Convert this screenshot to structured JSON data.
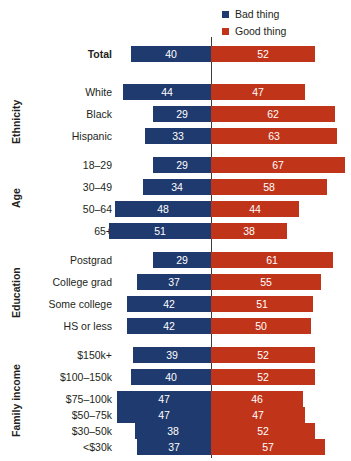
{
  "legend": {
    "items": [
      {
        "label": "Bad thing",
        "color": "#1f3a6e",
        "key": "bad"
      },
      {
        "label": "Good thing",
        "color": "#c0341a",
        "key": "good"
      }
    ]
  },
  "axis": {
    "center_value": 0,
    "units_per_px": 2.0
  },
  "groups": [
    {
      "name": "",
      "label": ""
    },
    {
      "name": "ethnicity",
      "label": "Ethnicity"
    },
    {
      "name": "age",
      "label": "Age"
    },
    {
      "name": "education",
      "label": "Education"
    },
    {
      "name": "family-income",
      "label": "Family income"
    }
  ],
  "chart_data": {
    "type": "bar",
    "orientation": "horizontal",
    "subtype": "diverging",
    "title": "",
    "subtitle": "",
    "xlabel": "",
    "ylabel": "",
    "grid": false,
    "legend_position": "top-right",
    "legend": [
      "Bad thing",
      "Good thing"
    ],
    "colors": {
      "Bad thing": "#1f3a6e",
      "Good thing": "#c0341a"
    },
    "categories": [
      "Total",
      "White",
      "Black",
      "Hispanic",
      "18–29",
      "30–49",
      "50–64",
      "65+",
      "Postgrad",
      "College grad",
      "Some college",
      "HS or less",
      "$150k+",
      "$100–150k",
      "$75–100k",
      "$50–75k",
      "$30–50k",
      "<$30k"
    ],
    "category_groups": [
      "",
      "Ethnicity",
      "Ethnicity",
      "Ethnicity",
      "Age",
      "Age",
      "Age",
      "Age",
      "Education",
      "Education",
      "Education",
      "Education",
      "Family income",
      "Family income",
      "Family income",
      "Family income",
      "Family income",
      "Family income"
    ],
    "series": [
      {
        "name": "Bad thing",
        "values": [
          40,
          44,
          29,
          33,
          29,
          34,
          48,
          51,
          29,
          37,
          42,
          42,
          39,
          40,
          47,
          47,
          38,
          37
        ]
      },
      {
        "name": "Good thing",
        "values": [
          52,
          47,
          62,
          63,
          67,
          58,
          44,
          38,
          61,
          55,
          51,
          50,
          52,
          52,
          46,
          47,
          52,
          57
        ]
      }
    ]
  },
  "rows": [
    {
      "label": "Total",
      "group": "",
      "bad": 40,
      "good": 52,
      "top": 46,
      "bold": true
    },
    {
      "label": "White",
      "group": "Ethnicity",
      "bad": 44,
      "good": 47,
      "top": 84,
      "bold": false
    },
    {
      "label": "Black",
      "group": "Ethnicity",
      "bad": 29,
      "good": 62,
      "top": 106,
      "bold": false
    },
    {
      "label": "Hispanic",
      "group": "Ethnicity",
      "bad": 33,
      "good": 63,
      "top": 128,
      "bold": false
    },
    {
      "label": "18–29",
      "group": "Age",
      "bad": 29,
      "good": 67,
      "top": 157,
      "bold": false
    },
    {
      "label": "30–49",
      "group": "Age",
      "bad": 34,
      "good": 58,
      "top": 179,
      "bold": false
    },
    {
      "label": "50–64",
      "group": "Age",
      "bad": 48,
      "good": 44,
      "top": 201,
      "bold": false
    },
    {
      "label": "65+",
      "group": "Age",
      "bad": 51,
      "good": 38,
      "top": 223,
      "bold": false
    },
    {
      "label": "Postgrad",
      "group": "Education",
      "bad": 29,
      "good": 61,
      "top": 252,
      "bold": false
    },
    {
      "label": "College grad",
      "group": "Education",
      "bad": 37,
      "good": 55,
      "top": 274,
      "bold": false
    },
    {
      "label": "Some college",
      "group": "Education",
      "bad": 42,
      "good": 51,
      "top": 296,
      "bold": false
    },
    {
      "label": "HS or less",
      "group": "Education",
      "bad": 42,
      "good": 50,
      "top": 318,
      "bold": false
    },
    {
      "label": "$150k+",
      "group": "Family income",
      "bad": 39,
      "good": 52,
      "top": 347,
      "bold": false
    },
    {
      "label": "$100–150k",
      "group": "Family income",
      "bad": 40,
      "good": 52,
      "top": 369,
      "bold": false
    },
    {
      "label": "$75–100k",
      "group": "Family income",
      "bad": 47,
      "good": 46,
      "top": 391,
      "bold": false
    },
    {
      "label": "$50–75k",
      "group": "Family income",
      "bad": 47,
      "good": 47,
      "top": 407,
      "bold": false
    },
    {
      "label": "$30–50k",
      "group": "Family income",
      "bad": 38,
      "good": 52,
      "top": 423,
      "bold": false
    },
    {
      "label": "<$30k",
      "group": "Family income",
      "bad": 37,
      "good": 57,
      "top": 439,
      "bold": false
    }
  ],
  "group_labels": [
    {
      "text": "Ethnicity",
      "top": 84,
      "height": 76
    },
    {
      "text": "Age",
      "top": 157,
      "height": 82
    },
    {
      "text": "Education",
      "top": 252,
      "height": 82
    },
    {
      "text": "Family income",
      "top": 347,
      "height": 108
    }
  ]
}
